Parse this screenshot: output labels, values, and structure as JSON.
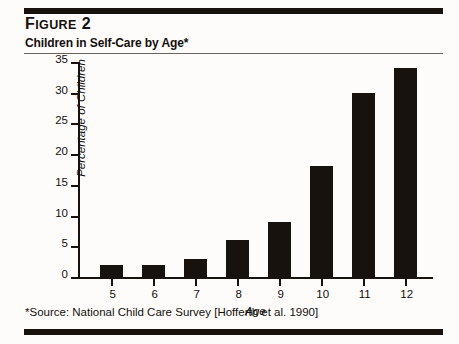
{
  "figure": {
    "label_prefix": "F",
    "label_small": "IGURE",
    "label_number": "2",
    "title": "Children in Self-Care by Age*",
    "source_note": "*Source: National Child Care Survey [Hofferth et al. 1990]"
  },
  "chart_data": {
    "type": "bar",
    "title": "Children in Self-Care by Age*",
    "xlabel": "Age",
    "ylabel": "Percentage of Children",
    "categories": [
      "5",
      "6",
      "7",
      "8",
      "9",
      "10",
      "11",
      "12"
    ],
    "values": [
      2,
      2,
      3,
      6,
      9,
      18,
      30,
      34
    ],
    "ylim": [
      0,
      35
    ],
    "yticks": [
      "0",
      "5",
      "10",
      "15",
      "20",
      "25",
      "30",
      "35"
    ],
    "ytick_values": [
      0,
      5,
      10,
      15,
      20,
      25,
      30,
      35
    ],
    "grid": false,
    "legend": "none",
    "bar_color": "#18120f",
    "background_color": "#fdfcfa"
  }
}
